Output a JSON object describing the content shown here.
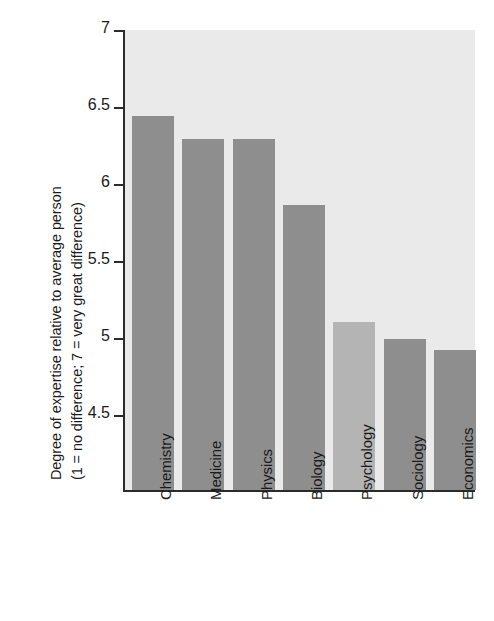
{
  "chart_data": {
    "type": "bar",
    "title": "",
    "xlabel": "",
    "ylabel_line1": "Degree of expertise relative to average person",
    "ylabel_line2": "(1 = no difference; 7 = very great difference)",
    "categories": [
      "Chemistry",
      "Medicine",
      "Physics",
      "Biology",
      "Psychology",
      "Sociology",
      "Economics"
    ],
    "values": [
      6.43,
      6.28,
      6.28,
      5.85,
      5.09,
      4.98,
      4.91
    ],
    "ylim": [
      4.0,
      7.0
    ],
    "yticks": [
      4.5,
      5,
      5.5,
      6,
      6.5,
      7
    ],
    "ytick_labels": [
      "4.5",
      "5",
      "5.5",
      "6",
      "6.5",
      "7"
    ],
    "grid": false,
    "legend": "none",
    "bar_colors": [
      "#8e8e8e",
      "#8e8e8e",
      "#8e8e8e",
      "#8e8e8e",
      "#b4b4b4",
      "#8e8e8e",
      "#8e8e8e"
    ],
    "highlight_category": "Psychology",
    "plot_background": "#eaeaea",
    "axis_color": "#2b2b2b",
    "text_color": "#1b1b1b"
  }
}
